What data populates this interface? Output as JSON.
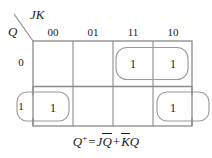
{
  "figure": {
    "name": "karnaugh-map-jk-flip-flop",
    "grid_line_color": "#8a8a8a",
    "group_loop_color": "#9a9a9a",
    "text_color": "#1a1a1a"
  },
  "axes": {
    "column_variable_label": "JK",
    "row_variable_label": "Q",
    "column_headers": [
      "00",
      "01",
      "11",
      "10"
    ],
    "row_headers": [
      "0",
      "1"
    ]
  },
  "cells": {
    "row0": [
      "",
      "",
      "1",
      "1"
    ],
    "row1": [
      "1",
      "",
      "",
      "1"
    ]
  },
  "equation": {
    "lhs": "Q",
    "lhs_superscript": "+",
    "equals": "=",
    "term1_var1": "J",
    "term1_var2_bar": "Q",
    "plus": "+",
    "term2_var1_bar": "K",
    "term2_var2": "Q"
  }
}
